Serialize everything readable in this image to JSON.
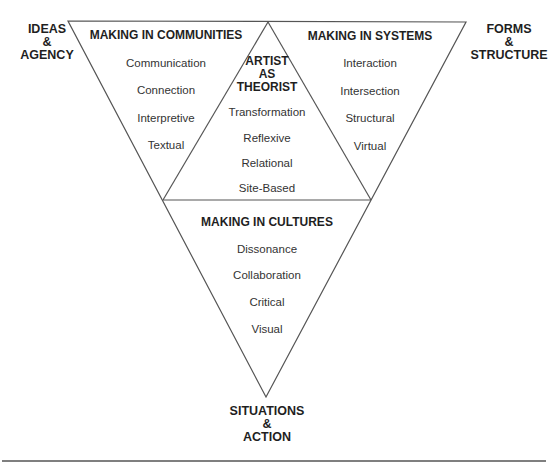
{
  "diagram": {
    "stroke_color": "#555555",
    "corners": {
      "top_left": [
        "IDEAS",
        "&",
        "AGENCY"
      ],
      "top_right": [
        "FORMS",
        "&",
        "STRUCTURE"
      ],
      "bottom": [
        "SITUATIONS",
        "&",
        "ACTION"
      ]
    },
    "sections": {
      "communities": {
        "title": "MAKING IN COMMUNITIES",
        "items": [
          "Communication",
          "Connection",
          "Interpretive",
          "Textual"
        ]
      },
      "systems": {
        "title": "MAKING IN SYSTEMS",
        "items": [
          "Interaction",
          "Intersection",
          "Structural",
          "Virtual"
        ]
      },
      "theorist": {
        "title": [
          "ARTIST",
          "AS",
          "THEORIST"
        ],
        "items": [
          "Transformation",
          "Reflexive",
          "Relational",
          "Site-Based"
        ]
      },
      "cultures": {
        "title": "MAKING IN CULTURES",
        "items": [
          "Dissonance",
          "Collaboration",
          "Critical",
          "Visual"
        ]
      }
    }
  }
}
